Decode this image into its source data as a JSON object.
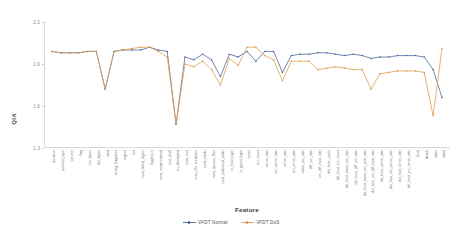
{
  "chart_data": {
    "type": "line",
    "title": "",
    "xlabel": "Feature",
    "ylabel": "QIA",
    "ylim": [
      1.3,
      2.2
    ],
    "yticks": [
      "2.2",
      "1.9",
      "1.6",
      "1.3"
    ],
    "grid": false,
    "legend_position": "bottom-center",
    "colors": {
      "VFDT Normal": "#5c6fa8",
      "VFDT DoS": "#e0a458",
      "axis": "#d9d9d9",
      "tick_text": "#6f6f6f"
    },
    "categories": [
      "duration",
      "protocol_type",
      "service",
      "flag",
      "src_bytes",
      "dst_bytes",
      "land",
      "wrong_fragment",
      "urgent",
      "hot",
      "num_failed_logins",
      "logged_in",
      "num_compromised",
      "root_shell",
      "su_attempted",
      "num_root",
      "num_file_creations",
      "num_shells",
      "num_access_files",
      "num_outbound_cmds",
      "is_host_login",
      "is_guest_login",
      "count",
      "srv_count",
      "serror_rate",
      "srv_serror_rate",
      "rerror_rate",
      "srv_rerror_rate",
      "same_srv_rate",
      "diff_srv_rate",
      "srv_diff_host_rate",
      "dst_host_count",
      "dst_host_srv_count",
      "dst_host_same_srv_rate",
      "dst_host_diff_srv_rate",
      "dst_host_same_src_port_rate",
      "dst_host_srv_diff_host_rate",
      "dst_host_serror_rate",
      "dst_host_srv_serror_rate",
      "dst_host_rerror_rate",
      "dst_host_srv_rerror_rate",
      "level",
      "attack",
      "class",
      "label"
    ],
    "series": [
      {
        "name": "VFDT Normal",
        "color": "#5c6fa8",
        "values": [
          1.99,
          1.98,
          1.98,
          1.98,
          1.99,
          1.99,
          1.72,
          1.99,
          2.0,
          2.0,
          2.0,
          2.02,
          2.0,
          1.99,
          1.47,
          1.95,
          1.93,
          1.97,
          1.93,
          1.81,
          1.97,
          1.95,
          1.99,
          1.92,
          1.99,
          1.99,
          1.84,
          1.96,
          1.97,
          1.97,
          1.98,
          1.98,
          1.97,
          1.96,
          1.97,
          1.96,
          1.94,
          1.95,
          1.95,
          1.96,
          1.96,
          1.96,
          1.95,
          1.86,
          1.66
        ]
      },
      {
        "name": "VFDT DoS",
        "color": "#e0a458",
        "values": [
          1.99,
          1.98,
          1.98,
          1.98,
          1.99,
          1.99,
          1.72,
          1.99,
          2.0,
          2.01,
          2.02,
          2.02,
          1.99,
          1.95,
          1.47,
          1.9,
          1.88,
          1.92,
          1.86,
          1.75,
          1.94,
          1.89,
          2.02,
          2.02,
          1.96,
          1.93,
          1.78,
          1.92,
          1.92,
          1.92,
          1.86,
          1.87,
          1.88,
          1.87,
          1.86,
          1.86,
          1.72,
          1.83,
          1.84,
          1.85,
          1.85,
          1.85,
          1.84,
          1.53,
          2.01
        ]
      }
    ]
  },
  "legend": {
    "items": [
      {
        "label": "VFDT Normal"
      },
      {
        "label": "VFDT DoS"
      }
    ]
  }
}
